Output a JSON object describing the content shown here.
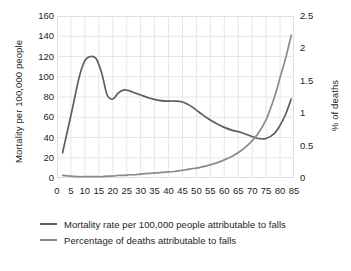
{
  "chart_data": {
    "type": "line",
    "title": "",
    "xlabel": "",
    "ylabel": "Mortality per 100,000 people",
    "y2label": "% of deaths",
    "xlim": [
      0,
      85
    ],
    "ylim": [
      0,
      160
    ],
    "y2lim": [
      0,
      2.5
    ],
    "grid": true,
    "legend_position": "bottom-left",
    "xticks": [
      "0",
      "5",
      "10",
      "15",
      "20",
      "25",
      "30",
      "35",
      "40",
      "45",
      "50",
      "55",
      "60",
      "65",
      "70",
      "75",
      "80",
      "85"
    ],
    "yticks_left": [
      "0",
      "20",
      "40",
      "60",
      "80",
      "100",
      "120",
      "140",
      "160"
    ],
    "yticks_right": [
      "0",
      "0.5",
      "1",
      "1.5",
      "2",
      "2.5"
    ],
    "x": [
      2,
      5,
      8,
      10,
      12,
      14,
      16,
      18,
      20,
      22,
      24,
      26,
      28,
      30,
      33,
      36,
      39,
      42,
      45,
      48,
      51,
      54,
      57,
      60,
      63,
      66,
      69,
      72,
      75,
      78,
      80,
      82,
      84
    ],
    "series": [
      {
        "name": "Mortality rate per 100,000 people attributable to falls",
        "axis": "left",
        "color": "#5e5e5e",
        "values": [
          25,
          62,
          100,
          116,
          120,
          118,
          104,
          82,
          78,
          84,
          87,
          86,
          84,
          82,
          79,
          77,
          76,
          76,
          75,
          71,
          65,
          59,
          54,
          50,
          47,
          45,
          42,
          39,
          39,
          44,
          52,
          63,
          78
        ]
      },
      {
        "name": "Percentage of deaths attributable to falls",
        "axis": "right",
        "color": "#8b8b8b",
        "values": [
          0.04,
          0.03,
          0.02,
          0.02,
          0.02,
          0.02,
          0.02,
          0.03,
          0.03,
          0.04,
          0.04,
          0.05,
          0.05,
          0.06,
          0.07,
          0.08,
          0.09,
          0.1,
          0.12,
          0.14,
          0.16,
          0.19,
          0.23,
          0.28,
          0.34,
          0.42,
          0.53,
          0.68,
          0.9,
          1.25,
          1.55,
          1.85,
          2.2
        ]
      }
    ]
  },
  "legend": {
    "items": [
      {
        "label": "Mortality rate per 100,000 people attributable to falls"
      },
      {
        "label": "Percentage of deaths attributable to falls"
      }
    ]
  }
}
